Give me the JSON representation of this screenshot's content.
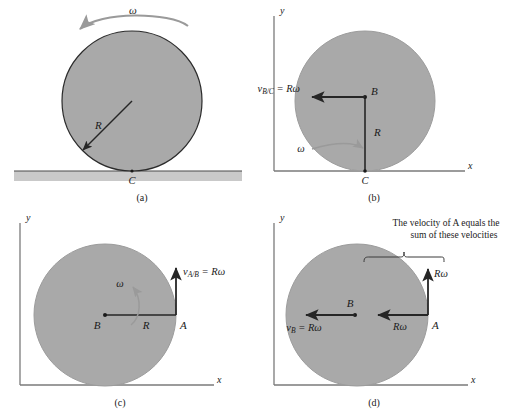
{
  "figure": {
    "colors": {
      "disk_fill": "#a9a9a9",
      "disk_stroke": "#2b2b2b",
      "ground_fill": "#c9c9c9",
      "axis": "#6e6e6e",
      "arrow_dark": "#262626",
      "arrow_gray": "#8c8c8c",
      "text": "#1a1a1a"
    }
  },
  "panel_a": {
    "caption": "(a)",
    "omega_label": "ω",
    "radius_label": "R",
    "contact_label": "C"
  },
  "panel_b": {
    "caption": "(b)",
    "axis_x": "x",
    "axis_y": "y",
    "velocity_label": "v",
    "velocity_sub": "B/C",
    "velocity_eq": " = Rω",
    "point_b": "B",
    "radius_label": "R",
    "omega_label": "ω",
    "contact_label": "C"
  },
  "panel_c": {
    "caption": "(c)",
    "axis_x": "x",
    "axis_y": "y",
    "velocity_label": "v",
    "velocity_sub": "A/B",
    "velocity_eq": " = Rω",
    "point_a": "A",
    "point_b": "B",
    "radius_label": "R",
    "omega_label": "ω"
  },
  "panel_d": {
    "caption": "(d)",
    "axis_x": "x",
    "axis_y": "y",
    "note_line1": "The velocity of A equals the",
    "note_line2": "sum of these velocities",
    "vb_label": "v",
    "vb_sub": "B",
    "vb_eq": " = Rω",
    "point_a": "A",
    "point_b": "B",
    "romega_horizontal": "Rω",
    "romega_vertical": "Rω"
  }
}
